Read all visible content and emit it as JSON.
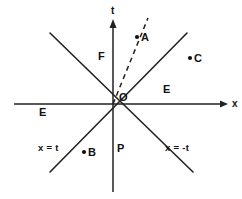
{
  "figure": {
    "kind": "minkowski-spacetime-diagram",
    "width": 242,
    "height": 199,
    "background_color": "#ffffff",
    "line_color": "#222222",
    "text_color": "#111111"
  },
  "axes": {
    "vertical": {
      "label": "t",
      "label_x": 111,
      "label_y": 8,
      "has_arrow": true,
      "x": 113,
      "y_top": 20,
      "y_bottom": 192
    },
    "horizontal": {
      "label": "x",
      "label_x": 232,
      "label_y": 99,
      "has_arrow": true,
      "y": 104,
      "x_left": 14,
      "x_right": 228
    },
    "origin": {
      "label": "O",
      "label_x": 119,
      "label_y": 92,
      "x": 113,
      "y": 104
    }
  },
  "lightcone_lines": [
    {
      "name": "x-equals-t",
      "label": "x = t",
      "label_x": 38,
      "label_y": 143,
      "x1": 50,
      "y1": 172,
      "x2": 187,
      "y2": 33
    },
    {
      "name": "x-equals-minus-t",
      "label": "x = -t",
      "label_x": 165,
      "label_y": 143,
      "x1": 50,
      "y1": 33,
      "x2": 193,
      "y2": 172
    }
  ],
  "worldline": {
    "name": "dashed-worldline-to-A",
    "style": "dashed",
    "x1": 113,
    "y1": 104,
    "x2": 148,
    "y2": 18
  },
  "regions": [
    {
      "key": "F",
      "label": "F",
      "x": 98,
      "y": 51,
      "meaning": "future"
    },
    {
      "key": "P",
      "label": "P",
      "x": 117,
      "y": 143,
      "meaning": "past"
    },
    {
      "key": "E-left",
      "label": "E",
      "x": 39,
      "y": 107,
      "meaning": "elsewhere-left"
    },
    {
      "key": "E-right",
      "label": "E",
      "x": 163,
      "y": 84,
      "meaning": "elsewhere-right"
    }
  ],
  "points": [
    {
      "key": "A",
      "label": "A",
      "dot_x": 137,
      "dot_y": 37,
      "label_x": 141,
      "label_y": 32
    },
    {
      "key": "B",
      "label": "B",
      "dot_x": 84,
      "dot_y": 152,
      "label_x": 88,
      "label_y": 147
    },
    {
      "key": "C",
      "label": "C",
      "dot_x": 190,
      "dot_y": 58,
      "label_x": 194,
      "label_y": 53
    }
  ]
}
